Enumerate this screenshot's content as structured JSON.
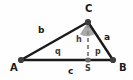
{
  "figure": {
    "type": "triangle-with-altitude",
    "background_color": "#fefefe",
    "stroke_color": "#1a1a1a",
    "dash_color": "#8c8c8c",
    "angle_fill_color": "#9a9a9a",
    "vertex_dot_color": "#3c3c3c",
    "width": 133,
    "height": 80
  },
  "vertices": [
    {
      "name": "A",
      "label": "A",
      "x": 21,
      "y": 60,
      "label_x": 10,
      "label_y": 63
    },
    {
      "name": "B",
      "label": "B",
      "x": 113,
      "y": 60,
      "label_x": 119,
      "label_y": 63
    },
    {
      "name": "C",
      "label": "C",
      "x": 88,
      "y": 22,
      "label_x": 85,
      "label_y": 5
    },
    {
      "name": "S",
      "label": "S",
      "x": 88,
      "y": 60,
      "label_x": 85,
      "label_y": 65
    }
  ],
  "sides": [
    {
      "name": "a",
      "label": "a",
      "from": "C",
      "to": "B",
      "label_x": 104,
      "label_y": 33
    },
    {
      "name": "b",
      "label": "b",
      "from": "A",
      "to": "C",
      "label_x": 38,
      "label_y": 27
    },
    {
      "name": "c",
      "label": "c",
      "from": "A",
      "to": "B",
      "label_x": 68,
      "label_y": 67
    }
  ],
  "segments": [
    {
      "name": "h",
      "label": "h",
      "from": "C",
      "to": "S",
      "style": "dashed",
      "label_x": 76,
      "label_y": 36
    },
    {
      "name": "q",
      "label": "q",
      "from": "A",
      "to": "S",
      "label_x": 55,
      "label_y": 48
    },
    {
      "name": "p",
      "label": "p",
      "from": "S",
      "to": "B",
      "label_x": 95,
      "label_y": 48
    }
  ],
  "angle_markers": [
    {
      "name": "gamma-at-C",
      "vertex": "C",
      "filled": true
    }
  ]
}
